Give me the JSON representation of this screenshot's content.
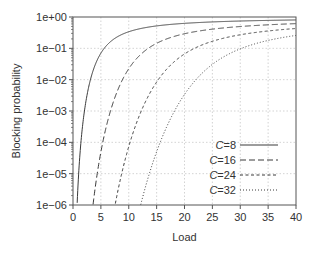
{
  "chart_data": {
    "type": "line",
    "title": "",
    "xlabel": "Load",
    "ylabel": "Blocking probability",
    "xlim": [
      0,
      40
    ],
    "ylim": [
      1e-06,
      1
    ],
    "yscale": "log",
    "grid": true,
    "legend_position": "lower right",
    "x_ticks": [
      0,
      5,
      10,
      15,
      20,
      25,
      30,
      35,
      40
    ],
    "x_tick_labels": [
      "0",
      "5",
      "10",
      "15",
      "20",
      "25",
      "30",
      "35",
      "40"
    ],
    "y_ticks": [
      1,
      0.1,
      0.01,
      0.001,
      0.0001,
      1e-05,
      1e-06
    ],
    "y_tick_labels": [
      "1e+00",
      "1e−01",
      "1e−02",
      "1e−03",
      "1e−04",
      "1e−05",
      "1e−06"
    ],
    "series": [
      {
        "name": "C=8",
        "prefix": "C",
        "value": "8",
        "channels": 8,
        "style": "solid",
        "dash": ""
      },
      {
        "name": "C=16",
        "prefix": "C",
        "value": "16",
        "channels": 16,
        "style": "dashed",
        "dash": "6,3"
      },
      {
        "name": "C=24",
        "prefix": "C",
        "value": "24",
        "channels": 24,
        "style": "dashed-short",
        "dash": "3,2.5"
      },
      {
        "name": "C=32",
        "prefix": "C",
        "value": "32",
        "channels": 32,
        "style": "dotted",
        "dash": "1,2"
      }
    ],
    "model": "Erlang B blocking probability vs offered load"
  },
  "colors": {
    "axis": "#555555",
    "grid": "#c8c8c8",
    "line": "#3a3a3a",
    "text": "#333333"
  }
}
